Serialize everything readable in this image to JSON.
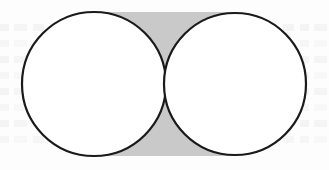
{
  "figure": {
    "canvas": {
      "width": 329,
      "height": 170
    },
    "background_color": "#fdfdfd",
    "shaded_color": "#c9c9c9",
    "stroke_color": "#1a1a1a",
    "fill_color": "#ffffff",
    "stroke_width": 2.2,
    "rectangle": {
      "name": "shaded-rectangle",
      "x": 96,
      "y": 12,
      "width": 138,
      "height": 144,
      "fill": "#c9c9c9"
    },
    "circles": [
      {
        "name": "left-circle",
        "cx": 94,
        "cy": 84,
        "r": 72,
        "fill": "#ffffff",
        "stroke": "#1a1a1a"
      },
      {
        "name": "right-circle",
        "cx": 235,
        "cy": 84,
        "r": 71,
        "fill": "#ffffff",
        "stroke": "#1a1a1a"
      }
    ],
    "labels": [],
    "annotations": [],
    "ghost_text_rows": [
      24,
      40,
      56,
      72,
      88,
      104,
      120,
      136
    ]
  }
}
